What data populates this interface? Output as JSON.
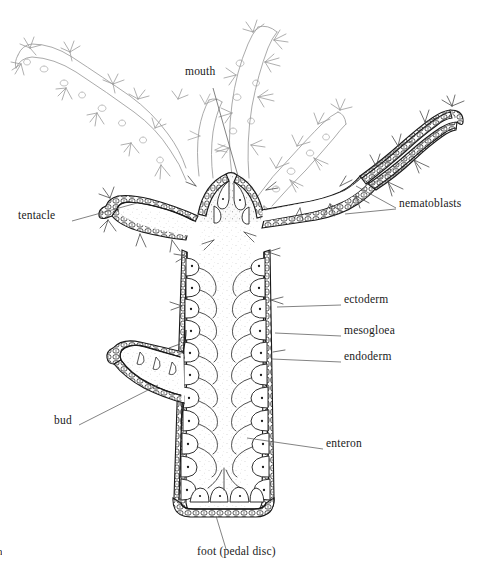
{
  "figure": {
    "background_color": "#ffffff",
    "ink_color": "#1a1a1a",
    "light_ink_color": "#8a8a8a",
    "width": 477,
    "height": 574
  },
  "labels": [
    {
      "id": "mouth",
      "text": "mouth",
      "x": 185,
      "y": 71,
      "align": "left",
      "leader": "M 213 88 L 238 176"
    },
    {
      "id": "tentacle",
      "text": "tentacle",
      "x": 18,
      "y": 215,
      "align": "left",
      "leader": "M 72 221 L 137 203"
    },
    {
      "id": "nematoblasts",
      "text": "nematoblasts",
      "x": 399,
      "y": 203,
      "align": "left",
      "leader": "M 396 208 L 356 186 M 396 209 L 345 214"
    },
    {
      "id": "ectoderm",
      "text": "ectoderm",
      "x": 344,
      "y": 299,
      "align": "left",
      "leader": "M 341 305 L 277 307"
    },
    {
      "id": "mesogloea",
      "text": "mesogloea",
      "x": 344,
      "y": 330,
      "align": "left",
      "leader": "M 341 336 L 275 333"
    },
    {
      "id": "endoderm",
      "text": "endoderm",
      "x": 344,
      "y": 356,
      "align": "left",
      "leader": "M 341 362 L 272 359"
    },
    {
      "id": "enteron",
      "text": "enteron",
      "x": 326,
      "y": 443,
      "align": "left",
      "leader": "M 323 449 L 247 438"
    },
    {
      "id": "bud",
      "text": "bud",
      "x": 54,
      "y": 420,
      "align": "left",
      "leader": "M 79 425 L 158 385"
    },
    {
      "id": "foot",
      "text": "foot (pedal disc)",
      "x": 197,
      "y": 551,
      "align": "left",
      "leader": "M 226 549 L 216 516"
    }
  ],
  "corner_mark": {
    "text": "n",
    "x": 0,
    "y": 545
  },
  "anatomy": {
    "parts": [
      "mouth",
      "tentacle",
      "nematoblasts",
      "ectoderm",
      "mesogloea",
      "endoderm",
      "enteron",
      "bud",
      "foot (pedal disc)"
    ]
  }
}
